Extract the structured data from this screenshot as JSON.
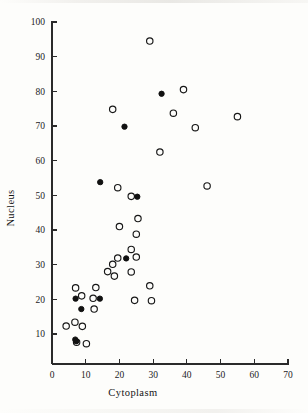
{
  "figure": {
    "background_color": "#fdfdfb",
    "ink_color": "#171717"
  },
  "chart_data": {
    "type": "scatter",
    "title": "",
    "subtitle": "",
    "xlabel": "Cytoplasm",
    "ylabel": "Nucleus",
    "xlim": [
      0,
      70
    ],
    "ylim": [
      5,
      100
    ],
    "xticks": [
      0,
      10,
      20,
      30,
      40,
      50,
      60,
      70
    ],
    "yticks": [
      10,
      20,
      30,
      40,
      50,
      60,
      70,
      80,
      90,
      100
    ],
    "xtick_labels": [
      "0",
      "10",
      "20",
      "30",
      "40",
      "50",
      "60",
      "70"
    ],
    "ytick_labels": [
      "10",
      "20",
      "30",
      "40",
      "50",
      "60",
      "70",
      "80",
      "90",
      "100"
    ],
    "grid": false,
    "legend": false,
    "legend_position": "none",
    "marker_size_px": 3.2,
    "series": [
      {
        "name": "open-circle",
        "marker": "open-circle",
        "color": "#171717",
        "points": [
          [
            29.0,
            94.5
          ],
          [
            39.0,
            80.5
          ],
          [
            18.0,
            74.8
          ],
          [
            36.0,
            73.7
          ],
          [
            55.0,
            72.7
          ],
          [
            42.5,
            69.5
          ],
          [
            32.0,
            62.5
          ],
          [
            46.0,
            52.7
          ],
          [
            19.5,
            52.2
          ],
          [
            23.5,
            49.7
          ],
          [
            25.5,
            43.3
          ],
          [
            20.0,
            41.0
          ],
          [
            25.0,
            38.8
          ],
          [
            23.5,
            34.4
          ],
          [
            25.0,
            32.2
          ],
          [
            19.5,
            31.9
          ],
          [
            18.0,
            30.1
          ],
          [
            23.5,
            27.9
          ],
          [
            16.5,
            28.0
          ],
          [
            18.5,
            26.7
          ],
          [
            29.0,
            23.9
          ],
          [
            13.0,
            23.4
          ],
          [
            7.0,
            23.3
          ],
          [
            8.8,
            21.0
          ],
          [
            12.2,
            20.3
          ],
          [
            24.5,
            19.7
          ],
          [
            29.5,
            19.6
          ],
          [
            12.5,
            17.2
          ],
          [
            6.8,
            13.4
          ],
          [
            4.2,
            12.3
          ],
          [
            9.0,
            12.2
          ],
          [
            7.3,
            7.6
          ],
          [
            10.2,
            7.2
          ]
        ]
      },
      {
        "name": "filled-circle",
        "marker": "filled-circle",
        "color": "#111111",
        "points": [
          [
            32.5,
            79.3
          ],
          [
            21.5,
            69.8
          ],
          [
            14.3,
            53.8
          ],
          [
            25.3,
            49.6
          ],
          [
            22.0,
            31.8
          ],
          [
            14.2,
            20.2
          ],
          [
            7.0,
            20.2
          ],
          [
            8.7,
            17.2
          ],
          [
            6.9,
            8.4
          ],
          [
            7.2,
            7.9
          ]
        ]
      }
    ]
  }
}
